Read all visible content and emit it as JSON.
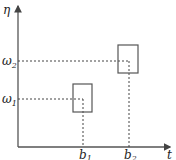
{
  "diagram": {
    "axes": {
      "y_label": "η",
      "x_label": "t"
    },
    "levels": [
      {
        "name": "ω",
        "sub": "1",
        "y": 99
      },
      {
        "name": "ω",
        "sub": "2",
        "y": 61
      }
    ],
    "ticks": [
      {
        "name": "b",
        "sub": "1",
        "x": 83
      },
      {
        "name": "b",
        "sub": "2",
        "x": 129
      }
    ],
    "boxes": [
      {
        "id": "box-1",
        "x": 73,
        "y": 84,
        "w": 19,
        "h": 28
      },
      {
        "id": "box-2",
        "x": 118,
        "y": 45,
        "w": 20,
        "h": 28
      }
    ],
    "colors": {
      "line": "#444444",
      "dash": "#444444"
    }
  }
}
